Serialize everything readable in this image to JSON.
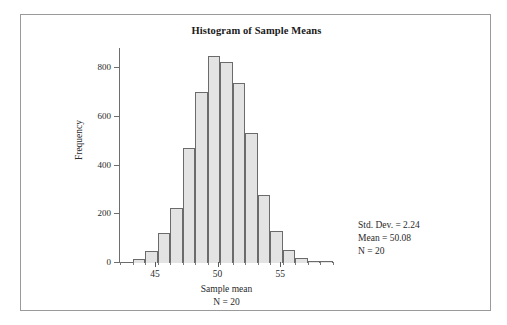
{
  "figure": {
    "title": "Histogram of Sample Means"
  },
  "axes": {
    "y_title": "Frequency",
    "y_ticks": [
      "0",
      "200",
      "400",
      "600",
      "800"
    ],
    "x_title": "Sample mean",
    "x_subtitle": "N = 20",
    "x_ticks": [
      "45",
      "50",
      "55"
    ]
  },
  "stats": {
    "std_dev": "Std. Dev. = 2.24",
    "mean": "Mean = 50.08",
    "n": "N = 20"
  },
  "chart_data": {
    "type": "bar",
    "title": "Histogram of Sample Means",
    "xlabel": "Sample mean",
    "xlabel_sub": "N = 20",
    "ylabel": "Frequency",
    "xlim": [
      42.2,
      59.3
    ],
    "ylim": [
      0,
      880
    ],
    "yticks": [
      0,
      200,
      400,
      600,
      800
    ],
    "xticks": [
      45,
      50,
      55
    ],
    "grid": false,
    "legend": null,
    "bin_width": 1,
    "bar_color": "#e3e3e3",
    "bar_edge_color": "#6b6b6b",
    "bin_centers": [
      42.7,
      43.7,
      44.7,
      45.7,
      46.7,
      47.7,
      48.7,
      49.7,
      50.7,
      51.7,
      52.7,
      53.7,
      54.7,
      55.7,
      56.7,
      57.7,
      58.7
    ],
    "values": [
      5,
      15,
      48,
      125,
      225,
      475,
      705,
      850,
      825,
      740,
      535,
      280,
      130,
      55,
      20,
      10,
      8
    ],
    "annotations": [
      "Std. Dev. = 2.24",
      "Mean = 50.08",
      "N = 20"
    ],
    "annotation_position": "right-lower"
  }
}
